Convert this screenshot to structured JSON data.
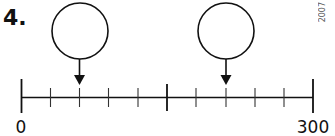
{
  "question": {
    "number_label": "4.",
    "copyright_text": "2007"
  },
  "number_line": {
    "start_label": "0",
    "end_label": "300",
    "start_value": 0,
    "end_value": 300,
    "intervals": 10,
    "tick_values": [
      0,
      30,
      60,
      90,
      120,
      150,
      180,
      210,
      240,
      270,
      300
    ],
    "major_tick_values": [
      0,
      150,
      300
    ]
  },
  "answer_boxes": [
    {
      "id": "circle-1",
      "points_to_value": 60,
      "answer": ""
    },
    {
      "id": "circle-2",
      "points_to_value": 210,
      "answer": ""
    }
  ],
  "colors": {
    "line": "#111111",
    "background": "#ffffff"
  }
}
